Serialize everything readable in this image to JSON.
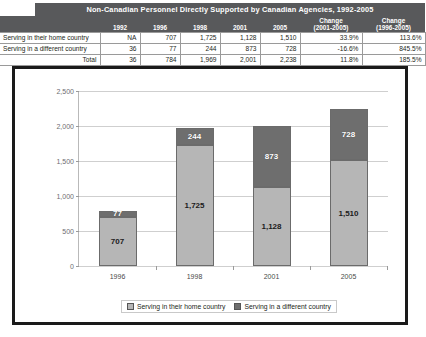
{
  "table": {
    "title": "Non-Canadian Personnel Directly Supported by Canadian Agencies, 1992-2005",
    "row_label_header": "",
    "columns": [
      "1992",
      "1996",
      "1998",
      "2001",
      "2005"
    ],
    "change_col_1": {
      "line1": "Change",
      "line2": "(2001-2005)"
    },
    "change_col_2": {
      "line1": "Change",
      "line2": "(1996-2005)"
    },
    "rows": [
      {
        "label": "Serving in their home country",
        "values": [
          "NA",
          "707",
          "1,725",
          "1,128",
          "1,510"
        ],
        "change_2001_2005": "33.9%",
        "change_1996_2005": "113.6%"
      },
      {
        "label": "Serving in a different country",
        "values": [
          "36",
          "77",
          "244",
          "873",
          "728"
        ],
        "change_2001_2005": "-16.6%",
        "change_1996_2005": "845.5%"
      }
    ],
    "total": {
      "label": "Total",
      "values": [
        "36",
        "784",
        "1,969",
        "2,001",
        "2,238"
      ],
      "change_2001_2005": "11.8%",
      "change_1996_2005": "185.5%"
    }
  },
  "chart_data": {
    "type": "bar",
    "stacked": true,
    "title": "",
    "xlabel": "",
    "ylabel": "",
    "categories": [
      "1996",
      "1998",
      "2001",
      "2005"
    ],
    "series": [
      {
        "name": "Serving in their home country",
        "values": [
          707,
          1725,
          1128,
          1510
        ],
        "color": "#b6b6b6"
      },
      {
        "name": "Serving in a different country",
        "values": [
          77,
          244,
          873,
          728
        ],
        "color": "#6e6e6e"
      }
    ],
    "value_labels": {
      "Serving in their home country": [
        "707",
        "1,725",
        "1,128",
        "1,510"
      ],
      "Serving in a different country": [
        "77",
        "244",
        "873",
        "728"
      ]
    },
    "ylim": [
      0,
      2500
    ],
    "yticks": [
      0,
      500,
      1000,
      1500,
      2000,
      2500
    ],
    "ytick_labels": [
      "0",
      "500",
      "1,000",
      "1,500",
      "2,000",
      "2,500"
    ],
    "grid": true,
    "legend_position": "bottom"
  },
  "legend": {
    "items": [
      {
        "label": "Serving in their home country",
        "swatch": "light"
      },
      {
        "label": "Serving in a different country",
        "swatch": "dark"
      }
    ]
  }
}
